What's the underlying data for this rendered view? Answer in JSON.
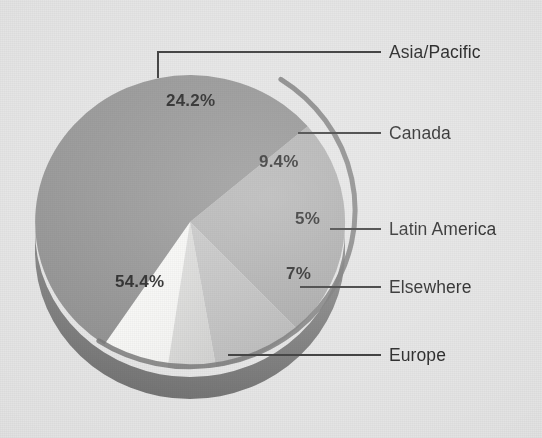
{
  "chart_data": {
    "type": "pie",
    "title": "",
    "subtitle": "",
    "xlabel": "",
    "ylabel": "",
    "legend_position": "leader-labels-right",
    "grid": false,
    "units": "percent",
    "categories": [
      "Asia/Pacific",
      "Canada",
      "Latin America",
      "Elsewhere",
      "Europe"
    ],
    "values": [
      24.2,
      9.4,
      5,
      7,
      54.4
    ],
    "value_labels": [
      "24.2%",
      "9.4%",
      "5%",
      "7%",
      "54.4%"
    ],
    "colors": [
      "#a8a8a8",
      "#b9b9b9",
      "#d4d4d4",
      "#f6f6f4",
      "#8a8a8a"
    ],
    "slices": [
      {
        "label": "Asia/Pacific",
        "value": 24.2,
        "value_label": "24.2%",
        "color": "#a8a8a8"
      },
      {
        "label": "Canada",
        "value": 9.4,
        "value_label": "9.4%",
        "color": "#b9b9b9"
      },
      {
        "label": "Latin America",
        "value": 5,
        "value_label": "5%",
        "color": "#d4d4d4"
      },
      {
        "label": "Elsewhere",
        "value": 7,
        "value_label": "7%",
        "color": "#f6f6f4"
      },
      {
        "label": "Europe",
        "value": 54.4,
        "value_label": "54.4%",
        "color": "#8a8a8a"
      }
    ],
    "total": 100
  },
  "labels": {
    "asia_pacific": "Asia/Pacific",
    "canada": "Canada",
    "latin_america": "Latin America",
    "elsewhere": "Elsewhere",
    "europe": "Europe"
  },
  "percents": {
    "asia_pacific": "24.2%",
    "canada": "9.4%",
    "latin_america": "5%",
    "elsewhere": "7%",
    "europe": "54.4%"
  },
  "style": {
    "background": "#e3e3e3",
    "leader_line": "#2b2b2b",
    "text": "#1b1b1b",
    "rim_shadow": "#6f6f6f"
  }
}
